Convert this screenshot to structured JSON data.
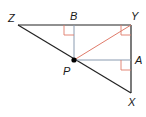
{
  "diagram": {
    "type": "geometry-triangle",
    "labels": {
      "Z": "Z",
      "B": "B",
      "Y": "Y",
      "P": "P",
      "A": "A",
      "X": "X"
    },
    "points": {
      "Z": [
        18,
        25
      ],
      "B": [
        74,
        25
      ],
      "Y": [
        131,
        25
      ],
      "P": [
        74,
        60
      ],
      "A": [
        131,
        60
      ],
      "X": [
        131,
        93
      ]
    },
    "segments": [
      {
        "from": "Z",
        "to": "Y",
        "color": "#222222"
      },
      {
        "from": "Y",
        "to": "X",
        "color": "#222222"
      },
      {
        "from": "Z",
        "to": "X",
        "color": "#222222"
      },
      {
        "from": "P",
        "to": "B",
        "color": "#8a9bb0"
      },
      {
        "from": "P",
        "to": "A",
        "color": "#8a9bb0"
      },
      {
        "from": "P",
        "to": "Y",
        "color": "#e07b6a"
      }
    ],
    "right_angle_marks": [
      "B",
      "Y",
      "A"
    ],
    "colors": {
      "triangle": "#222222",
      "perpendicular": "#8a9bb0",
      "bisector": "#e07b6a",
      "right_angle_mark": "#e07b6a",
      "point": "#000000"
    }
  }
}
